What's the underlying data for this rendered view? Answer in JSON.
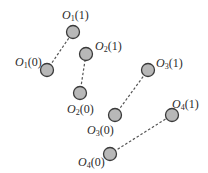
{
  "diagram": {
    "background": "#ffffff",
    "node_fill": "#b8b8b8",
    "node_stroke": "#3a3a3a",
    "edge_color": "#555555",
    "edge_style": "dashed",
    "pairs": [
      {
        "id": "O1",
        "start": {
          "label_base": "O",
          "label_sub": "1",
          "label_arg": "(0)",
          "cx": 47,
          "cy": 70
        },
        "end": {
          "label_base": "O",
          "label_sub": "1",
          "label_arg": "(1)",
          "cx": 73,
          "cy": 32
        }
      },
      {
        "id": "O2",
        "start": {
          "label_base": "O",
          "label_sub": "2",
          "label_arg": "(0)",
          "cx": 80,
          "cy": 93
        },
        "end": {
          "label_base": "O",
          "label_sub": "2",
          "label_arg": "(1)",
          "cx": 86,
          "cy": 54
        }
      },
      {
        "id": "O3",
        "start": {
          "label_base": "O",
          "label_sub": "3",
          "label_arg": "(0)",
          "cx": 115,
          "cy": 115
        },
        "end": {
          "label_base": "O",
          "label_sub": "3",
          "label_arg": "(1)",
          "cx": 148,
          "cy": 70
        }
      },
      {
        "id": "O4",
        "start": {
          "label_base": "O",
          "label_sub": "4",
          "label_arg": "(0)",
          "cx": 110,
          "cy": 154
        },
        "end": {
          "label_base": "O",
          "label_sub": "4",
          "label_arg": "(1)",
          "cx": 172,
          "cy": 115
        }
      }
    ]
  }
}
